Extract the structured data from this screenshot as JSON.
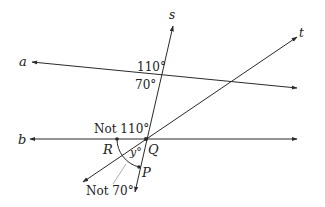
{
  "diagram": {
    "lines": [
      {
        "name": "a",
        "label": "a"
      },
      {
        "name": "b",
        "label": "b"
      },
      {
        "name": "s",
        "label": "s"
      },
      {
        "name": "t",
        "label": "t"
      }
    ],
    "points": [
      {
        "name": "Q",
        "label": "Q"
      },
      {
        "name": "R",
        "label": "R"
      },
      {
        "name": "P",
        "label": "P"
      }
    ],
    "angles": {
      "upper": "110°",
      "lower": "70°",
      "not_110": "Not 110°",
      "y": "y°",
      "not_70": "Not 70°"
    },
    "colors": {
      "line": "#2a2a2a",
      "pointer": "#999999"
    }
  }
}
